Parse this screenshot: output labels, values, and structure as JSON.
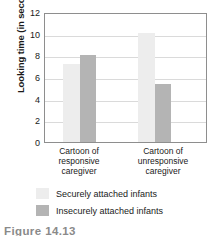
{
  "chart_data": {
    "type": "bar",
    "title": "",
    "xlabel": "",
    "ylabel": "Looking time (in seconds)",
    "ylim": [
      0,
      12
    ],
    "yticks": [
      12,
      10,
      8,
      6,
      4,
      2,
      0
    ],
    "grid": true,
    "legend_position": "bottom",
    "categories": [
      "Cartoon of responsive caregiver",
      "Cartoon of unresponsive caregiver"
    ],
    "category_lines": [
      [
        "Cartoon of",
        "responsive",
        "caregiver"
      ],
      [
        "Cartoon of",
        "unresponsive",
        "caregiver"
      ]
    ],
    "series": [
      {
        "name": "Securely attached infants",
        "color": "#ededed",
        "values": [
          7.2,
          10.1
        ]
      },
      {
        "name": "Insecurely attached infants",
        "color": "#b4b4b4",
        "values": [
          8.0,
          5.4
        ]
      }
    ]
  },
  "axis": {
    "y_title": "Looking time (in seconds)",
    "tick_12": "12",
    "tick_10": "10",
    "tick_8": "8",
    "tick_6": "6",
    "tick_4": "4",
    "tick_2": "2",
    "tick_0": "0"
  },
  "categories": {
    "group1_line1": "Cartoon of",
    "group1_line2": "responsive",
    "group1_line3": "caregiver",
    "group2_line1": "Cartoon of",
    "group2_line2": "unresponsive",
    "group2_line3": "caregiver"
  },
  "legend": {
    "securely_label": "Securely attached infants",
    "insecurely_label": "Insecurely attached infants"
  },
  "caption": {
    "text": "Figure 14.13"
  },
  "colors": {
    "securely": "#ededed",
    "insecurely": "#b4b4b4",
    "frame": "#8e8e8e",
    "gridline": "#dadada",
    "text": "#1a1a1a"
  }
}
